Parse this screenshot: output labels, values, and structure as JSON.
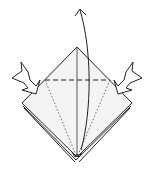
{
  "diagram": {
    "type": "origami-step",
    "colors": {
      "paper": "#f4f4f4",
      "line": "#222222",
      "background": "#ffffff"
    },
    "elements": {
      "paper_outline": "diamond",
      "valley_fold_line": "horizontal dashed",
      "crease_lines": "dotted diagonals",
      "center_line": "vertical",
      "fold_arrow": "curved arrow up",
      "push_arrows": [
        "left",
        "right"
      ]
    }
  }
}
